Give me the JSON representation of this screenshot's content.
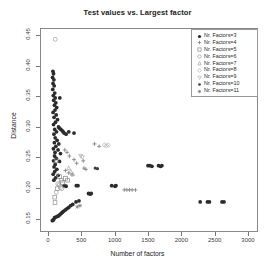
{
  "chart_data": {
    "type": "scatter",
    "title": "Test values vs. Largest factor",
    "xlabel": "Number of factors",
    "ylabel": "Distance",
    "xlim": [
      -120,
      3150
    ],
    "ylim": [
      0.128,
      0.462
    ],
    "grid": false,
    "legend_position": "top-right",
    "xticks": [
      0,
      500,
      1000,
      1500,
      2000,
      2500,
      3000
    ],
    "xtick_labels": [
      "0",
      "500",
      "1000",
      "1500",
      "2000",
      "2500",
      "3000"
    ],
    "yticks": [
      0.15,
      0.2,
      0.25,
      0.3,
      0.35,
      0.4,
      0.45
    ],
    "ytick_labels": [
      "0.15",
      "0.20",
      "0.25",
      "0.30",
      "0.35",
      "0.40",
      "0.45"
    ],
    "series": [
      {
        "name": "Nr. Factors=3",
        "marker": "filled-circle",
        "color": "#2b2b2b",
        "points": [
          [
            60,
            0.392
          ],
          [
            70,
            0.388
          ],
          [
            55,
            0.382
          ],
          [
            75,
            0.378
          ],
          [
            62,
            0.372
          ],
          [
            80,
            0.368
          ],
          [
            58,
            0.362
          ],
          [
            88,
            0.356
          ],
          [
            66,
            0.352
          ],
          [
            95,
            0.348
          ],
          [
            72,
            0.344
          ],
          [
            105,
            0.34
          ],
          [
            84,
            0.336
          ],
          [
            118,
            0.332
          ],
          [
            92,
            0.328
          ],
          [
            63,
            0.324
          ],
          [
            110,
            0.32
          ],
          [
            78,
            0.316
          ],
          [
            130,
            0.312
          ],
          [
            99,
            0.308
          ],
          [
            70,
            0.304
          ],
          [
            145,
            0.3
          ],
          [
            88,
            0.296
          ],
          [
            115,
            0.292
          ],
          [
            76,
            0.288
          ],
          [
            160,
            0.298
          ],
          [
            180,
            0.296
          ],
          [
            200,
            0.294
          ],
          [
            215,
            0.292
          ],
          [
            230,
            0.29
          ],
          [
            260,
            0.288
          ],
          [
            300,
            0.292
          ],
          [
            380,
            0.29
          ],
          [
            165,
            0.348
          ],
          [
            95,
            0.282
          ],
          [
            125,
            0.278
          ],
          [
            82,
            0.274
          ],
          [
            150,
            0.272
          ],
          [
            105,
            0.268
          ],
          [
            68,
            0.264
          ],
          [
            138,
            0.262
          ],
          [
            92,
            0.258
          ],
          [
            175,
            0.256
          ],
          [
            85,
            0.252
          ],
          [
            112,
            0.248
          ],
          [
            70,
            0.244
          ],
          [
            160,
            0.243
          ],
          [
            95,
            0.238
          ],
          [
            78,
            0.234
          ],
          [
            120,
            0.23
          ],
          [
            88,
            0.226
          ],
          [
            65,
            0.222
          ],
          [
            140,
            0.22
          ],
          [
            100,
            0.216
          ],
          [
            75,
            0.212
          ],
          [
            230,
            0.203
          ],
          [
            260,
            0.202
          ],
          [
            415,
            0.203
          ],
          [
            440,
            0.203
          ],
          [
            600,
            0.19
          ],
          [
            625,
            0.189
          ],
          [
            640,
            0.19
          ],
          [
            950,
            0.203
          ],
          [
            1000,
            0.202
          ],
          [
            1015,
            0.203
          ],
          [
            1500,
            0.236
          ],
          [
            1530,
            0.236
          ],
          [
            1560,
            0.235
          ],
          [
            1660,
            0.236
          ],
          [
            1690,
            0.235
          ],
          [
            1710,
            0.236
          ],
          [
            2290,
            0.176
          ],
          [
            2400,
            0.176
          ],
          [
            2430,
            0.176
          ],
          [
            2620,
            0.176
          ],
          [
            2650,
            0.176
          ],
          [
            85,
            0.15
          ],
          [
            105,
            0.151
          ],
          [
            125,
            0.152
          ],
          [
            145,
            0.153
          ],
          [
            165,
            0.155
          ],
          [
            185,
            0.157
          ],
          [
            205,
            0.159
          ],
          [
            225,
            0.161
          ],
          [
            250,
            0.163
          ],
          [
            275,
            0.165
          ],
          [
            300,
            0.167
          ],
          [
            330,
            0.17
          ],
          [
            360,
            0.172
          ],
          [
            410,
            0.176
          ],
          [
            455,
            0.178
          ],
          [
            72,
            0.147
          ],
          [
            62,
            0.146
          ],
          [
            52,
            0.145
          ]
        ]
      },
      {
        "name": "Nr. Factors=4",
        "marker": "plus",
        "color": "#6b6b6b",
        "points": [
          [
            240,
            0.262
          ],
          [
            275,
            0.258
          ],
          [
            310,
            0.252
          ],
          [
            380,
            0.246
          ],
          [
            420,
            0.24
          ],
          [
            250,
            0.228
          ],
          [
            300,
            0.224
          ],
          [
            350,
            0.221
          ],
          [
            530,
            0.232
          ],
          [
            560,
            0.23
          ],
          [
            1140,
            0.196
          ],
          [
            1180,
            0.196
          ],
          [
            1220,
            0.196
          ],
          [
            1260,
            0.196
          ],
          [
            1310,
            0.196
          ],
          [
            520,
            0.244
          ],
          [
            690,
            0.272
          ],
          [
            760,
            0.268
          ]
        ]
      },
      {
        "name": "Nr. Factors=5",
        "marker": "open-square",
        "color": "#8a8a8a",
        "points": [
          [
            110,
            0.244
          ],
          [
            160,
            0.218
          ],
          [
            185,
            0.212
          ],
          [
            205,
            0.208
          ],
          [
            125,
            0.198
          ],
          [
            88,
            0.184
          ],
          [
            92,
            0.175
          ],
          [
            250,
            0.215
          ],
          [
            282,
            0.212
          ]
        ]
      },
      {
        "name": "Nr. Factors=6",
        "marker": "open-circle",
        "color": "#9a9a9a",
        "points": [
          [
            95,
            0.445
          ],
          [
            135,
            0.206
          ],
          [
            155,
            0.204
          ],
          [
            110,
            0.192
          ],
          [
            175,
            0.2
          ],
          [
            195,
            0.198
          ]
        ]
      },
      {
        "name": "Nr. Factors=7",
        "marker": "open-triangle",
        "color": "#a5a5a5",
        "points": [
          [
            330,
            0.226
          ],
          [
            360,
            0.222
          ],
          [
            300,
            0.232
          ]
        ]
      },
      {
        "name": "Nr. Factors=8",
        "marker": "open-diamond",
        "color": "#aaaaaa",
        "points": [
          [
            840,
            0.27
          ],
          [
            870,
            0.269
          ],
          [
            900,
            0.27
          ]
        ]
      },
      {
        "name": "Nr. Factors=9",
        "marker": "triangle-down",
        "color": "#b0b0b0",
        "points": [
          [
            480,
            0.252
          ],
          [
            505,
            0.25
          ]
        ]
      },
      {
        "name": "Nr. Factors=10",
        "marker": "filled-circle-small",
        "color": "#3d3d3d",
        "points": [
          [
            700,
            0.232
          ],
          [
            735,
            0.231
          ]
        ]
      },
      {
        "name": "Nr. Factors=11",
        "marker": "star",
        "color": "#6f6f6f",
        "points": [
          [
            430,
            0.168
          ],
          [
            470,
            0.17
          ]
        ]
      }
    ]
  },
  "legend": {
    "entries": [
      {
        "label": "Nr. Factors=3",
        "marker": "filled-circle"
      },
      {
        "label": "Nr. Factors=4",
        "marker": "plus"
      },
      {
        "label": "Nr. Factors=5",
        "marker": "open-square"
      },
      {
        "label": "Nr. Factors=6",
        "marker": "open-circle"
      },
      {
        "label": "Nr. Factors=7",
        "marker": "open-triangle"
      },
      {
        "label": "Nr. Factors=8",
        "marker": "open-diamond"
      },
      {
        "label": "Nr. Factors=9",
        "marker": "triangle-down"
      },
      {
        "label": "Nr. Factors=10",
        "marker": "filled-circle-small"
      },
      {
        "label": "Nr. Factors=11",
        "marker": "star"
      }
    ]
  }
}
